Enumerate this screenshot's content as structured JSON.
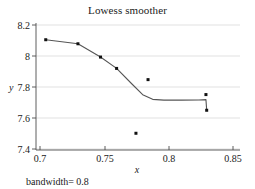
{
  "chart_data": {
    "type": "scatter",
    "title": "Lowess smoother",
    "xlabel": "x",
    "ylabel": "y",
    "note": "bandwidth= 0.8",
    "xlim": [
      0.6935,
      0.857
    ],
    "ylim": [
      7.375,
      8.225
    ],
    "grid": true,
    "legend": null,
    "xticks": [
      0.7,
      0.75,
      0.8,
      0.85
    ],
    "xtick_labels": [
      "0.7",
      "0.75",
      "0.8",
      "0.85"
    ],
    "yticks": [
      7.4,
      7.6,
      7.8,
      8.0,
      8.2
    ],
    "ytick_labels": [
      "7.4",
      "7.6",
      "7.8",
      "8",
      "8.2"
    ],
    "points": [
      {
        "x": 0.7013,
        "y": 8.113
      },
      {
        "x": 0.7271,
        "y": 8.086
      },
      {
        "x": 0.7452,
        "y": 7.997
      },
      {
        "x": 0.7581,
        "y": 7.921
      },
      {
        "x": 0.7736,
        "y": 7.487
      },
      {
        "x": 0.7833,
        "y": 7.846
      },
      {
        "x": 0.8297,
        "y": 7.746
      },
      {
        "x": 0.8303,
        "y": 7.641
      }
    ],
    "series": [
      {
        "name": "lowess",
        "type": "line",
        "x": [
          0.7013,
          0.7271,
          0.7452,
          0.7581,
          0.77,
          0.779,
          0.787,
          0.796,
          0.81,
          0.824,
          0.8297,
          0.8303
        ],
        "values": [
          8.113,
          8.086,
          7.997,
          7.921,
          7.82,
          7.745,
          7.714,
          7.709,
          7.709,
          7.71,
          7.712,
          7.641
        ]
      }
    ]
  }
}
